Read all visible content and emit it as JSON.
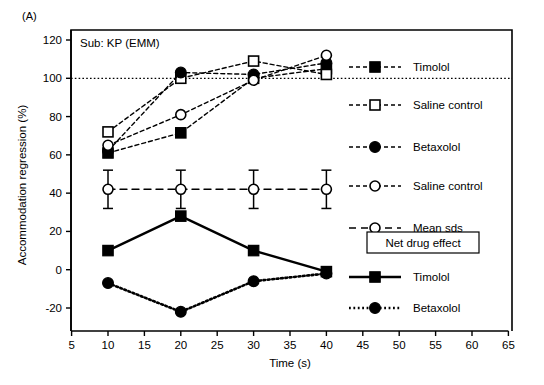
{
  "panel": {
    "label": "(A)",
    "subject": "Sub: KP (EMM)"
  },
  "chart_data": {
    "type": "line",
    "title": "",
    "xlabel": "Time (s)",
    "ylabel": "Accommodation regression (%)",
    "xlim": [
      5,
      65
    ],
    "ylim": [
      -28,
      126
    ],
    "xticks": [
      5,
      10,
      15,
      20,
      25,
      30,
      35,
      40,
      45,
      50,
      55,
      60,
      65
    ],
    "yticks": [
      -20,
      0,
      20,
      40,
      60,
      80,
      100,
      120
    ],
    "xtick_labels": [
      "5",
      "10",
      "15",
      "20",
      "25",
      "30",
      "35",
      "40",
      "45",
      "50",
      "55",
      "60",
      "65"
    ],
    "ytick_labels": [
      "-20",
      "0",
      "20",
      "40",
      "60",
      "80",
      "100",
      "120"
    ],
    "grid": false,
    "reference_lines": [
      {
        "name": "100-percent-reference",
        "y": 100,
        "style": "dotted"
      }
    ],
    "x": [
      10,
      20,
      30,
      40
    ],
    "series": [
      {
        "name": "Timolol",
        "group": "regression",
        "marker": "filled-square",
        "line": "dashed",
        "values": [
          61,
          71.5,
          100,
          105
        ]
      },
      {
        "name": "Saline control",
        "group": "regression",
        "marker": "open-square",
        "line": "dashed",
        "values": [
          72,
          100,
          109,
          102
        ]
      },
      {
        "name": "Betaxolol",
        "group": "regression",
        "marker": "filled-circle",
        "line": "dashed",
        "values": [
          62,
          103,
          102,
          108
        ]
      },
      {
        "name": "Saline control",
        "group": "regression",
        "marker": "open-circle",
        "line": "dashed",
        "values": [
          65,
          81,
          99,
          112
        ]
      },
      {
        "name": "Mean sds",
        "group": "sds",
        "marker": "open-circle",
        "line": "dashed-long",
        "values": [
          42,
          42,
          42,
          42
        ],
        "errors": [
          10,
          10,
          10,
          10
        ]
      },
      {
        "name": "Timolol",
        "group": "net",
        "marker": "filled-square",
        "line": "solid",
        "values": [
          10,
          28,
          10,
          -1
        ]
      },
      {
        "name": "Betaxolol",
        "group": "net",
        "marker": "filled-circle",
        "line": "dotted",
        "values": [
          -7,
          -22,
          -6,
          -2
        ]
      }
    ],
    "legend_position": "right-outside"
  },
  "legend": {
    "regression_entries": [
      {
        "label": "Timolol",
        "marker": "filled-square",
        "line": "dashed"
      },
      {
        "label": "Saline control",
        "marker": "open-square",
        "line": "dashed"
      },
      {
        "label": "Betaxolol",
        "marker": "filled-circle",
        "line": "dashed"
      },
      {
        "label": "Saline control",
        "marker": "open-circle",
        "line": "dashed"
      },
      {
        "label": "Mean sds",
        "marker": "open-circle",
        "line": "dashed-long"
      }
    ],
    "net_box_title": "Net drug effect",
    "net_entries": [
      {
        "label": "Timolol",
        "marker": "filled-square",
        "line": "solid"
      },
      {
        "label": "Betaxolol",
        "marker": "filled-circle",
        "line": "dotted"
      }
    ]
  },
  "colors": {
    "foreground": "#000000",
    "background": "#ffffff"
  }
}
